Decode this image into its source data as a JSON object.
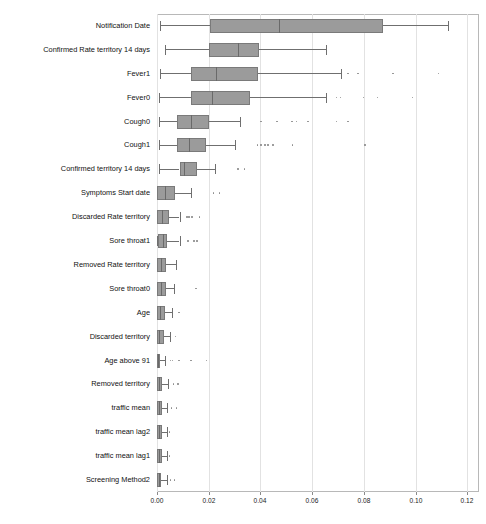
{
  "chart_data": {
    "type": "box",
    "title": "",
    "xlabel": "",
    "ylabel": "",
    "xlim": [
      0.0,
      0.1245
    ],
    "xticks": [
      0.0,
      0.02,
      0.04,
      0.06,
      0.08,
      0.1,
      0.12
    ],
    "xtick_labels": [
      "0.00",
      "0.02",
      "0.04",
      "0.06",
      "0.08",
      "0.10",
      "0.12"
    ],
    "grid": "vertical",
    "legend": "none",
    "orientation": "horizontal",
    "box_fill_color": "#9b9b9b",
    "box_edge_color": "#7a7a7a",
    "whisker_color": "#6f6f6f",
    "gridline_color": "#e2e2e2",
    "frame_color": "#b8b8b8",
    "categories": [
      "Notification Date",
      "Confirmed Rate territory 14 days",
      "Fever1",
      "Fever0",
      "Cough0",
      "Cough1",
      "Confirmed territory 14 days",
      "Symptoms Start date",
      "Discarded Rate territory",
      "Sore throat1",
      "Removed Rate territory",
      "Sore throat0",
      "Age",
      "Discarded territory",
      "Age above 91",
      "Removed territory",
      "traffic mean",
      "traffic mean lag2",
      "traffic mean lag1",
      "Screening Method2"
    ],
    "boxes": [
      {
        "label": "Notification Date",
        "whisker_low": 0.0011,
        "q1": 0.0203,
        "median": 0.047,
        "q3": 0.0875,
        "whisker_high": 0.1125,
        "outliers": []
      },
      {
        "label": "Confirmed Rate territory 14 days",
        "whisker_low": 0.003,
        "q1": 0.02,
        "median": 0.0313,
        "q3": 0.0396,
        "whisker_high": 0.0653,
        "outliers": []
      },
      {
        "label": "Fever1",
        "whisker_low": 0.0011,
        "q1": 0.0132,
        "median": 0.023,
        "q3": 0.0389,
        "whisker_high": 0.071,
        "outliers": [
          0.0736,
          0.0773,
          0.0909,
          0.1086
        ]
      },
      {
        "label": "Fever0",
        "whisker_low": 0.0008,
        "q1": 0.0132,
        "median": 0.0211,
        "q3": 0.0358,
        "whisker_high": 0.0653,
        "outliers": [
          0.0691,
          0.0706,
          0.0796,
          0.0849,
          0.0985
        ]
      },
      {
        "label": "Cough0",
        "whisker_low": 0.0008,
        "q1": 0.0079,
        "median": 0.0132,
        "q3": 0.02,
        "whisker_high": 0.0321,
        "outliers": [
          0.04,
          0.046,
          0.052,
          0.0536,
          0.0581,
          0.0691,
          0.0736
        ]
      },
      {
        "label": "Cough1",
        "whisker_low": 0.0008,
        "q1": 0.0079,
        "median": 0.0124,
        "q3": 0.0189,
        "whisker_high": 0.0302,
        "outliers": [
          0.0385,
          0.04,
          0.0415,
          0.0426,
          0.0445,
          0.0521,
          0.08
        ]
      },
      {
        "label": "Confirmed territory 14 days",
        "whisker_low": 0.0008,
        "q1": 0.0087,
        "median": 0.0106,
        "q3": 0.0155,
        "whisker_high": 0.0226,
        "outliers": [
          0.0309,
          0.0336
        ]
      },
      {
        "label": "Symptoms Start date",
        "whisker_low": 0.0,
        "q1": 0.0,
        "median": 0.003,
        "q3": 0.0068,
        "whisker_high": 0.0132,
        "outliers": [
          0.0215,
          0.0238
        ]
      },
      {
        "label": "Discarded Rate territory",
        "whisker_low": 0.0,
        "q1": 0.0,
        "median": 0.0019,
        "q3": 0.0045,
        "whisker_high": 0.0087,
        "outliers": [
          0.0113,
          0.0121,
          0.0132,
          0.0162
        ]
      },
      {
        "label": "Sore throat1",
        "whisker_low": 0.0,
        "q1": 0.0004,
        "median": 0.0023,
        "q3": 0.0038,
        "whisker_high": 0.0087,
        "outliers": [
          0.0117,
          0.014,
          0.0151
        ]
      },
      {
        "label": "Removed Rate territory",
        "whisker_low": 0.0,
        "q1": 0.0,
        "median": 0.0015,
        "q3": 0.0034,
        "whisker_high": 0.0072,
        "outliers": []
      },
      {
        "label": "Sore throat0",
        "whisker_low": 0.0,
        "q1": 0.0,
        "median": 0.0015,
        "q3": 0.0034,
        "whisker_high": 0.0064,
        "outliers": [
          0.0147
        ]
      },
      {
        "label": "Age",
        "whisker_low": 0.0,
        "q1": 0.0,
        "median": 0.0011,
        "q3": 0.003,
        "whisker_high": 0.0057,
        "outliers": [
          0.0083
        ]
      },
      {
        "label": "Discarded territory",
        "whisker_low": 0.0,
        "q1": 0.0,
        "median": 0.0008,
        "q3": 0.0026,
        "whisker_high": 0.0049,
        "outliers": [
          0.0068
        ]
      },
      {
        "label": "Age above 91",
        "whisker_low": 0.0,
        "q1": 0.0,
        "median": 0.0002,
        "q3": 0.0011,
        "whisker_high": 0.003,
        "outliers": [
          0.0049,
          0.0057,
          0.0083,
          0.0128,
          0.0189
        ]
      },
      {
        "label": "Removed territory",
        "whisker_low": 0.0,
        "q1": 0.0,
        "median": 0.0008,
        "q3": 0.0019,
        "whisker_high": 0.0042,
        "outliers": [
          0.006,
          0.0079
        ]
      },
      {
        "label": "traffic mean",
        "whisker_low": 0.0,
        "q1": 0.0,
        "median": 0.0008,
        "q3": 0.0019,
        "whisker_high": 0.0038,
        "outliers": [
          0.0053,
          0.0072
        ]
      },
      {
        "label": "traffic mean lag2",
        "whisker_low": 0.0,
        "q1": 0.0,
        "median": 0.0008,
        "q3": 0.0019,
        "whisker_high": 0.0038,
        "outliers": [
          0.0045
        ]
      },
      {
        "label": "traffic mean lag1",
        "whisker_low": 0.0,
        "q1": 0.0,
        "median": 0.0008,
        "q3": 0.0019,
        "whisker_high": 0.0038,
        "outliers": [
          0.0045
        ]
      },
      {
        "label": "Screening Method2",
        "whisker_low": 0.0,
        "q1": 0.0,
        "median": 0.0008,
        "q3": 0.0015,
        "whisker_high": 0.0038,
        "outliers": [
          0.0049,
          0.0064
        ]
      }
    ]
  },
  "layout": {
    "plot_left": 157,
    "plot_top": 14,
    "plot_right": 479,
    "plot_bottom": 492,
    "label_right_edge": 150,
    "row_count": 20
  }
}
